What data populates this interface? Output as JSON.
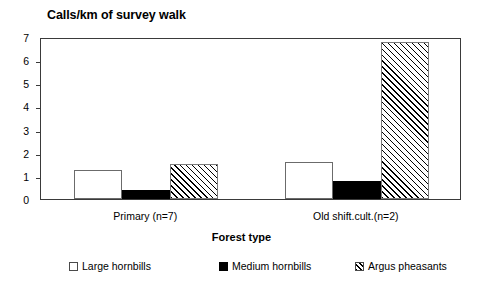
{
  "chart_data": {
    "type": "bar",
    "title": "Calls/km of survey walk",
    "xlabel": "Forest type",
    "ylabel": "",
    "categories": [
      "Primary (n=7)",
      "Old shift.cult.(n=2)"
    ],
    "series": [
      {
        "name": "Large hornbills",
        "values": [
          1.25,
          1.6
        ],
        "fill": "white",
        "swatch": "legend-swatch-large"
      },
      {
        "name": "Medium hornbills",
        "values": [
          0.4,
          0.8
        ],
        "fill": "black",
        "swatch": "legend-swatch-medium"
      },
      {
        "name": "Argus pheasants",
        "values": [
          1.5,
          6.8
        ],
        "fill": "hatched",
        "swatch": "legend-swatch-argus"
      }
    ],
    "ylim": [
      0,
      7
    ],
    "yticks": [
      0,
      1,
      2,
      3,
      4,
      5,
      6,
      7
    ],
    "ytick_labels": [
      "0",
      "1",
      "2",
      "3",
      "4",
      "5",
      "6",
      "7"
    ],
    "grid": false,
    "legend_position": "bottom",
    "frame": true,
    "colors": {
      "axis": "#3a3a3a",
      "text": "#000000",
      "bar_outline": "#6b6b6b",
      "bar_fill_black": "#000000",
      "background": "#ffffff"
    }
  }
}
